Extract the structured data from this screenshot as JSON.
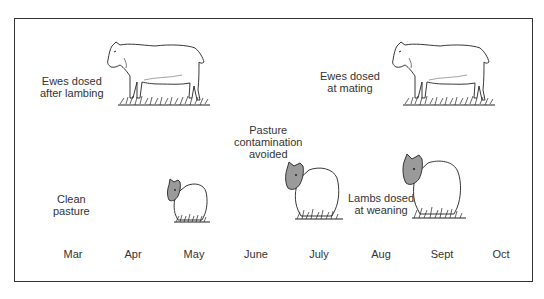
{
  "diagram": {
    "annotations": {
      "ewes_after_lambing": [
        "Ewes dosed",
        "after lambing"
      ],
      "ewes_at_mating": [
        "Ewes dosed",
        "at mating"
      ],
      "pasture_contamination": [
        "Pasture",
        "contamination",
        "avoided"
      ],
      "clean_pasture": [
        "Clean",
        "pasture"
      ],
      "lambs_at_weaning": [
        "Lambs dosed",
        "at weaning"
      ]
    },
    "months": [
      "Mar",
      "Apr",
      "May",
      "June",
      "July",
      "Aug",
      "Sept",
      "Oct"
    ],
    "figures": [
      {
        "type": "ewe",
        "month": "May",
        "row": "top"
      },
      {
        "type": "ewe",
        "month": "Sept",
        "row": "top"
      },
      {
        "type": "lamb",
        "month": "May",
        "size": "small"
      },
      {
        "type": "lamb",
        "month": "July",
        "size": "medium"
      },
      {
        "type": "lamb",
        "month": "Sept",
        "size": "large"
      }
    ],
    "colors": {
      "frame": "#333333",
      "text": "#333333",
      "lamb_face": "#9a9a9a",
      "grass": "#222222"
    }
  }
}
